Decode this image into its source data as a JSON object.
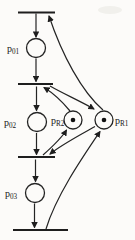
{
  "figure": {
    "kind": "petri-net-diagram",
    "background_color": "#fcfbf9",
    "ink_color": "#242424",
    "places": [
      {
        "id": "p01",
        "base": "p",
        "sub": "01",
        "tokens": 0
      },
      {
        "id": "p02",
        "base": "p",
        "sub": "02",
        "tokens": 0
      },
      {
        "id": "p03",
        "base": "p",
        "sub": "03",
        "tokens": 0
      },
      {
        "id": "pR2",
        "base": "p",
        "sub": "R2",
        "tokens": 1
      },
      {
        "id": "pR1",
        "base": "p",
        "sub": "R1",
        "tokens": 1
      }
    ],
    "transitions": [
      {
        "id": "t1"
      },
      {
        "id": "t2"
      },
      {
        "id": "t3"
      },
      {
        "id": "t4"
      }
    ],
    "arcs": [
      {
        "from": "t1",
        "to": "p01"
      },
      {
        "from": "p01",
        "to": "t2"
      },
      {
        "from": "t2",
        "to": "p02"
      },
      {
        "from": "p02",
        "to": "t3"
      },
      {
        "from": "t3",
        "to": "p03"
      },
      {
        "from": "p03",
        "to": "t4"
      },
      {
        "from": "pR1",
        "to": "t1"
      },
      {
        "from": "pR2",
        "to": "t2"
      },
      {
        "from": "t2",
        "to": "pR1"
      },
      {
        "from": "pR1",
        "to": "t3"
      },
      {
        "from": "t3",
        "to": "pR2"
      },
      {
        "from": "t4",
        "to": "pR1"
      }
    ]
  }
}
